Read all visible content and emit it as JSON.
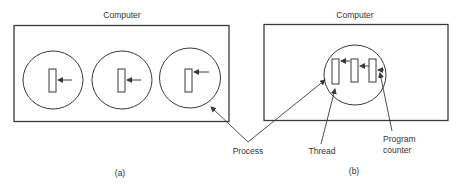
{
  "figure": {
    "panel_a": {
      "computer_label": "Computer",
      "caption": "(a)",
      "process_count": 3,
      "threads_per_process": 1
    },
    "panel_b": {
      "computer_label": "Computer",
      "caption": "(b)",
      "process_count": 1,
      "threads_per_process": 3
    },
    "labels": {
      "process": "Process",
      "thread": "Thread",
      "program_counter_line1": "Program",
      "program_counter_line2": "counter"
    },
    "colors": {
      "line": "#3a3a3a",
      "text": "#333333",
      "background": "#ffffff"
    }
  }
}
